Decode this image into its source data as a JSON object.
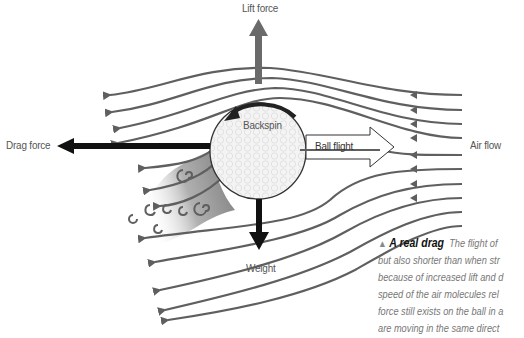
{
  "labels": {
    "lift": "Lift force",
    "drag": "Drag force",
    "weight": "Weight",
    "backspin": "Backspin",
    "ball_flight": "Ball flight",
    "air_flow": "Air flow"
  },
  "caption": {
    "marker": "▲",
    "heading": "A real drag",
    "lines": [
      "The flight of",
      "but also shorter than when str",
      "because of increased lift and d",
      "speed of the air molecules rel",
      "force still exists on the ball in a",
      "are moving in the same direct"
    ]
  },
  "colors": {
    "streamline": "#5f5f5f",
    "force_arrow": "#111111",
    "lift_arrow": "#6a6a6a",
    "wake_dark": "#8a8a8a",
    "ball_fill": "#f4f4f4"
  }
}
